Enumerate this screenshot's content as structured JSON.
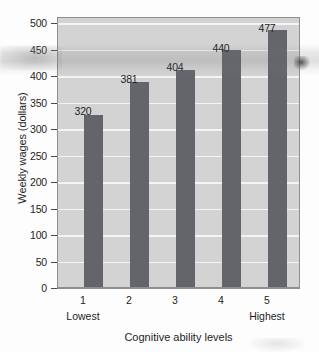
{
  "chart_data": {
    "type": "bar",
    "title": "",
    "categories": [
      "1",
      "2",
      "3",
      "4",
      "5"
    ],
    "values": [
      320,
      381,
      404,
      440,
      477
    ],
    "value_labels": [
      "320",
      "381",
      "404",
      "440",
      "477"
    ],
    "xlabel": "Cognitive ability levels",
    "ylabel": "Weekly wages (dollars)",
    "ylim": [
      0,
      500
    ],
    "ytick_labels": [
      "500",
      "450",
      "400",
      "350",
      "300",
      "250",
      "200",
      "150",
      "100",
      "50",
      "0"
    ],
    "ytick_values": [
      500,
      450,
      400,
      350,
      300,
      250,
      200,
      150,
      100,
      50,
      0
    ],
    "xtick_labels": [
      "1",
      "2",
      "3",
      "4",
      "5"
    ],
    "x_end_labels": {
      "low": "Lowest",
      "high": "Highest"
    },
    "grid": true,
    "legend": "none",
    "colors": {
      "bar": "#63656b",
      "plot_background": "#d3d3d3",
      "gridline": "#f4f4f4",
      "axis": "#6d6d6d",
      "text": "#1d1d1d",
      "page_background": "#fdfdfd"
    }
  }
}
